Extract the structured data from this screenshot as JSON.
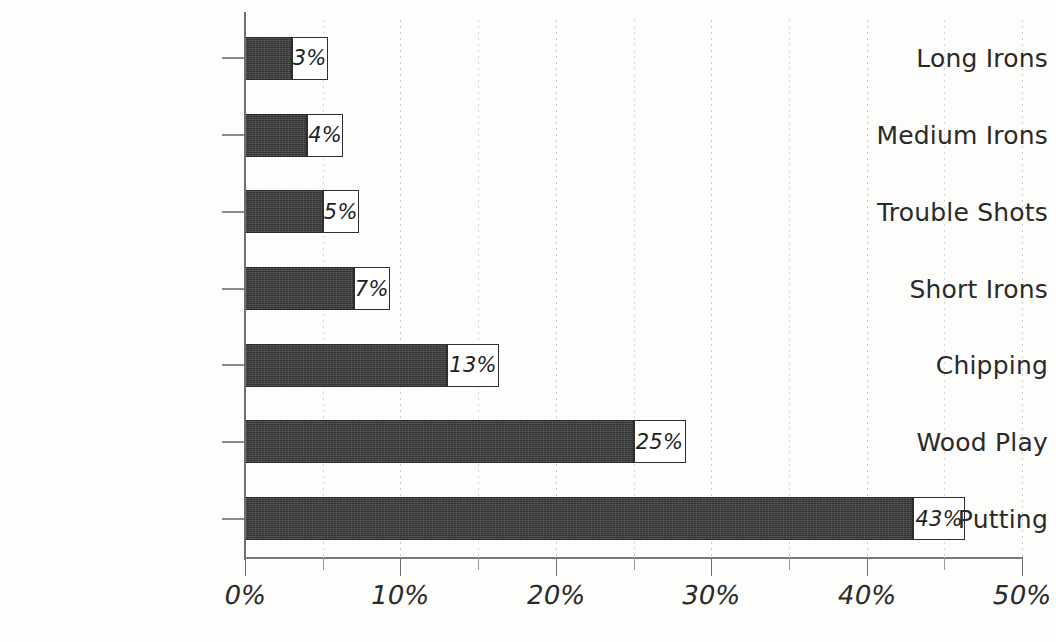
{
  "chart_data": {
    "type": "bar",
    "orientation": "horizontal",
    "title": "",
    "subtitle": "",
    "xlabel": "",
    "ylabel": "",
    "xlim": [
      0,
      50
    ],
    "x_tick_labels": [
      "0%",
      "10%",
      "20%",
      "30%",
      "40%",
      "50%"
    ],
    "x_ticks": [
      0,
      10,
      20,
      30,
      40,
      50
    ],
    "x_minor_ticks": [
      5,
      15,
      25,
      35,
      45
    ],
    "grid": "vertical-dotted",
    "legend": "none",
    "categories": [
      "Long Irons",
      "Medium Irons",
      "Trouble Shots",
      "Short Irons",
      "Chipping",
      "Wood Play",
      "Putting"
    ],
    "values": [
      3,
      4,
      5,
      7,
      13,
      25,
      43
    ],
    "data_labels": [
      "3%",
      "4%",
      "5%",
      "7%",
      "13%",
      "25%",
      "43%"
    ],
    "bar_color": "#3b3b3b",
    "label_box_fill": "#ffffff",
    "label_box_border": "#2f2f2f",
    "axis_color": "#6e6e6e",
    "gridline_color": "#c9c9c9",
    "background": "#fdfdfc"
  }
}
